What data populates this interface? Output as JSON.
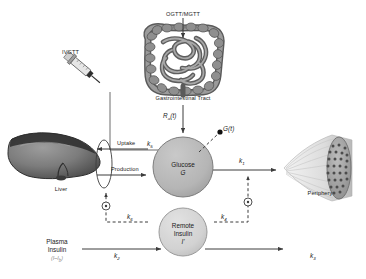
{
  "figure": {
    "background_color": "#ffffff"
  },
  "anatomy": {
    "gi_tract": {
      "label": "Gastrointestinal Tract",
      "icon": "intestine-icon"
    },
    "liver": {
      "label": "Liver",
      "icon": "liver-icon"
    },
    "periphery": {
      "label": "Periphery",
      "icon": "muscle-fiber-icon"
    },
    "syringe": {
      "label": "IVGTT",
      "icon": "syringe-icon"
    }
  },
  "inputs": {
    "oral": {
      "label": "OGTT/MGTT",
      "arrow": "down-arrow-icon"
    },
    "iv": {
      "label": "IVGTT"
    },
    "appearance_rate": {
      "label": "Ra(t)",
      "base": "R",
      "sub": "a",
      "arg": "(t)"
    }
  },
  "compartments": [
    {
      "id": "glucose",
      "line1": "Glucose",
      "line2": "G",
      "fill": "#b8b8b8",
      "stroke": "#6e6e6e"
    },
    {
      "id": "remote-insulin",
      "line1": "Remote",
      "line2": "Insulin",
      "line3": "I'",
      "fill": "#d3d3d3",
      "stroke": "#8a8a8a"
    }
  ],
  "plasma_insulin": {
    "line1": "Plasma",
    "line2": "Insulin",
    "line3": "(I–I",
    "line3_sub": "b",
    "line3_end": ")"
  },
  "liver_flux": {
    "uptake": "Uptake",
    "production": "Production"
  },
  "measurements": {
    "glucose_signal": {
      "label": "G(t)",
      "marker": "filled-dot"
    }
  },
  "rates": [
    {
      "id": "k5",
      "base": "k",
      "sub": "5",
      "meaning": "hepatic-uptake"
    },
    {
      "id": "k1",
      "base": "k",
      "sub": "1",
      "meaning": "peripheral-disposal"
    },
    {
      "id": "k6",
      "base": "k",
      "sub": "6",
      "meaning": "remote-insulin-to-liver"
    },
    {
      "id": "k4",
      "base": "k",
      "sub": "4",
      "meaning": "remote-insulin-to-periphery"
    },
    {
      "id": "k2",
      "base": "k",
      "sub": "2",
      "meaning": "plasma-to-remote-insulin"
    },
    {
      "id": "k3",
      "base": "k",
      "sub": "3",
      "meaning": "remote-insulin-clearance"
    }
  ],
  "modulators": [
    {
      "id": "liver-modulator",
      "glyph": "⊙",
      "position": "left"
    },
    {
      "id": "periphery-modulator",
      "glyph": "⊙",
      "position": "right"
    }
  ],
  "colors": {
    "line": "#4a4a4a",
    "dashed": "#4a4a4a",
    "glucose_fill": "#b8b8b8",
    "insulin_fill": "#d3d3d3",
    "text": "#1a1a1a",
    "muted_text": "#8a8a8a"
  }
}
